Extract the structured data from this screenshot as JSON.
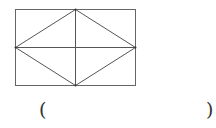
{
  "figure": {
    "type": "rectangle-with-inscribed-rhombus",
    "stroke_color": "#555555",
    "rectangle": {
      "x": 15,
      "y": 9,
      "width": 120,
      "height": 76
    },
    "lines": [
      {
        "name": "vertical-midline",
        "from": [
          75,
          9
        ],
        "to": [
          75,
          85
        ]
      },
      {
        "name": "horizontal-midline",
        "from": [
          15,
          47
        ],
        "to": [
          135,
          47
        ]
      }
    ],
    "rhombus": [
      [
        75,
        9
      ],
      [
        135,
        47
      ],
      [
        75,
        85
      ],
      [
        15,
        47
      ]
    ]
  },
  "answer": {
    "open_paren": "(",
    "blank": "",
    "close_paren": ")"
  }
}
